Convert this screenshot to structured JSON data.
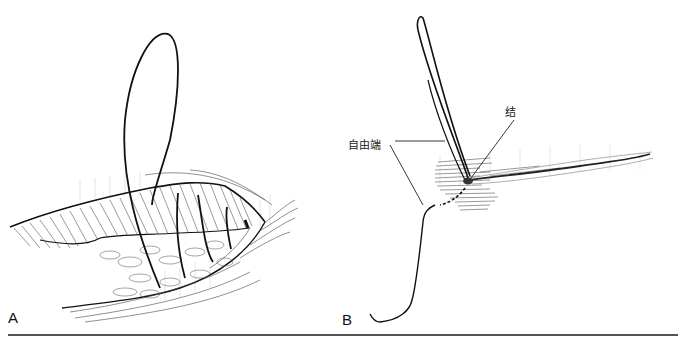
{
  "figure": {
    "panels": [
      {
        "id": "A",
        "letter": "A",
        "description": "Running suture through wound edges with loop"
      },
      {
        "id": "B",
        "letter": "B",
        "description": "Knot with free end of suture at wound"
      }
    ],
    "labels": {
      "free_end": "自由端",
      "knot": "结"
    },
    "colors": {
      "line": "#111111",
      "hatch": "#555555",
      "tissue_shade": "#cccccc",
      "rule": "#555555",
      "background": "#ffffff"
    }
  }
}
